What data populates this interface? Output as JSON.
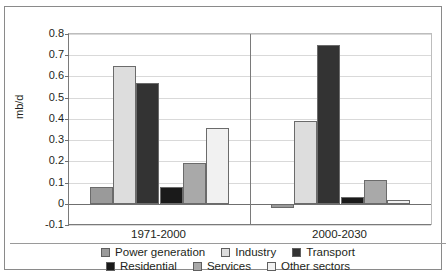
{
  "axis": {
    "ylabel": "mb/d",
    "yticks": [
      "0.8",
      "0.7",
      "0.6",
      "0.5",
      "0.4",
      "0.3",
      "0.2",
      "0.1",
      "0",
      "-0.1"
    ],
    "ymin": -0.1,
    "ymax": 0.8
  },
  "legend": {
    "rows": [
      [
        {
          "label": "Power generation",
          "color": "#9a9a9a"
        },
        {
          "label": "Industry",
          "color": "#dddddd"
        },
        {
          "label": "Transport",
          "color": "#333333"
        }
      ],
      [
        {
          "label": "Residential",
          "color": "#1a1a1a"
        },
        {
          "label": "Services",
          "color": "#a9a9a9"
        },
        {
          "label": "Other sectors",
          "color": "#f1f1f1"
        }
      ]
    ]
  },
  "chart_data": {
    "type": "bar",
    "title": "",
    "xlabel": "",
    "ylabel": "mb/d",
    "ylim": [
      -0.1,
      0.8
    ],
    "grid": true,
    "legend_position": "bottom",
    "categories": [
      "1971-2000",
      "2000-2030"
    ],
    "series": [
      {
        "name": "Power generation",
        "color": "#9a9a9a",
        "values": [
          0.08,
          -0.02
        ]
      },
      {
        "name": "Industry",
        "color": "#dddddd",
        "values": [
          0.65,
          0.39
        ]
      },
      {
        "name": "Transport",
        "color": "#333333",
        "values": [
          0.57,
          0.75
        ]
      },
      {
        "name": "Residential",
        "color": "#1a1a1a",
        "values": [
          0.08,
          0.03
        ]
      },
      {
        "name": "Services",
        "color": "#a9a9a9",
        "values": [
          0.19,
          0.11
        ]
      },
      {
        "name": "Other sectors",
        "color": "#f1f1f1",
        "values": [
          0.355,
          0.02
        ]
      }
    ]
  }
}
